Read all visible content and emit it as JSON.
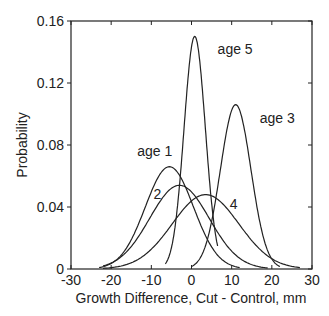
{
  "chart_data": {
    "type": "line",
    "title": "",
    "xlabel": "Growth Difference, Cut - Control, mm",
    "ylabel": "Probability",
    "xlim": [
      -30,
      30
    ],
    "ylim": [
      0,
      0.16
    ],
    "xticks": [
      -30,
      -20,
      -10,
      0,
      10,
      20,
      30
    ],
    "xtick_labels": [
      "-30",
      "-20",
      "-10",
      "0",
      "10",
      "20",
      "30"
    ],
    "yticks": [
      0,
      0.04,
      0.08,
      0.12,
      0.16
    ],
    "ytick_labels": [
      "0",
      "0.04",
      "0.08",
      "0.12",
      "0.16"
    ],
    "grid": false,
    "legend": "none (curves labeled inline)",
    "series": [
      {
        "name": "age 1",
        "label": "age 1",
        "mean": -5.5,
        "peak": 0.066,
        "sd": 6.0,
        "x_range": [
          -23,
          12
        ],
        "label_pos": [
          -13.5,
          0.073
        ]
      },
      {
        "name": "age 2",
        "label": "2",
        "mean": -3.0,
        "peak": 0.054,
        "sd": 7.4,
        "x_range": [
          -22,
          19
        ],
        "label_pos": [
          -8.5,
          0.045
        ]
      },
      {
        "name": "age 3",
        "label": "age 3",
        "mean": 11.0,
        "peak": 0.106,
        "sd": 3.8,
        "x_range": [
          0,
          22
        ],
        "label_pos": [
          17,
          0.094
        ]
      },
      {
        "name": "age 4",
        "label": "4",
        "mean": 3.5,
        "peak": 0.048,
        "sd": 8.3,
        "x_range": [
          -22,
          27
        ],
        "label_pos": [
          10.5,
          0.039
        ]
      },
      {
        "name": "age 5",
        "label": "age 5",
        "mean": 0.8,
        "peak": 0.15,
        "sd": 2.65,
        "x_range": [
          -6.5,
          6.5
        ],
        "label_pos": [
          6.5,
          0.139
        ]
      }
    ]
  }
}
